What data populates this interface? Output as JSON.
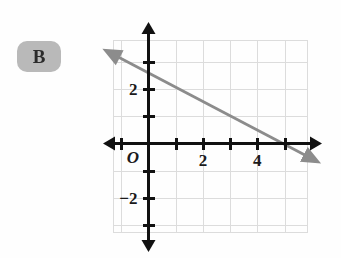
{
  "figure": {
    "item_label": "B",
    "item_label_color": "#b9b9b9"
  },
  "chart_data": {
    "type": "line",
    "title": "",
    "subtitle": "",
    "xlabel": "",
    "ylabel": "",
    "xlim": [
      -1.3,
      6.4
    ],
    "ylim": [
      -3.7,
      4.5
    ],
    "grid": true,
    "grid_color": "#dcdcdc",
    "grid_step": 1,
    "axis_color": "#111111",
    "legend": "none",
    "origin_label": "O",
    "x_tick_labels": [
      {
        "value": 2,
        "text": "2"
      },
      {
        "value": 4,
        "text": "4"
      }
    ],
    "y_tick_labels": [
      {
        "value": 2,
        "text": "2"
      },
      {
        "value": -2,
        "text": "−2"
      }
    ],
    "x_ticks": [
      -1,
      1,
      2,
      3,
      4,
      5,
      6
    ],
    "y_ticks": [
      -3,
      -2,
      -1,
      1,
      2,
      3,
      4
    ],
    "series": [
      {
        "name": "line-1",
        "color": "#8c8c8c",
        "x_intercept": 4.2,
        "y_intercept": 2.3,
        "slope": -0.548,
        "arrow_start": {
          "x": -1.15,
          "y": 3.2
        },
        "arrow_end": {
          "x": 5.8,
          "y": -0.45
        },
        "style": "double-arrow"
      }
    ],
    "grid_bounds": {
      "xmin": -1.3,
      "xmax": 5.9,
      "ymin": -3.3,
      "ymax": 3.8
    }
  }
}
